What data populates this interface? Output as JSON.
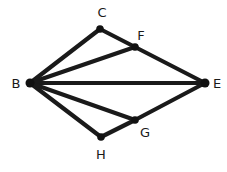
{
  "diagram": {
    "type": "graph",
    "nodes": [
      {
        "id": "B",
        "label": "B",
        "x": 30,
        "y": 83,
        "label_x": 16,
        "label_y": 84
      },
      {
        "id": "C",
        "label": "C",
        "x": 100,
        "y": 29,
        "label_x": 102,
        "label_y": 13
      },
      {
        "id": "F",
        "label": "F",
        "x": 135,
        "y": 47,
        "label_x": 141,
        "label_y": 36
      },
      {
        "id": "E",
        "label": "E",
        "x": 205,
        "y": 83,
        "label_x": 217,
        "label_y": 84
      },
      {
        "id": "G",
        "label": "G",
        "x": 135,
        "y": 120,
        "label_x": 145,
        "label_y": 133
      },
      {
        "id": "H",
        "label": "H",
        "x": 101,
        "y": 137,
        "label_x": 101,
        "label_y": 155
      }
    ],
    "edges": [
      {
        "from": "B",
        "to": "C"
      },
      {
        "from": "C",
        "to": "F"
      },
      {
        "from": "F",
        "to": "E"
      },
      {
        "from": "B",
        "to": "F"
      },
      {
        "from": "B",
        "to": "E"
      },
      {
        "from": "B",
        "to": "G"
      },
      {
        "from": "B",
        "to": "H"
      },
      {
        "from": "H",
        "to": "G"
      },
      {
        "from": "G",
        "to": "E"
      }
    ],
    "colors": {
      "edge": "#1a1a1a",
      "node": "#111111",
      "label": "#1a1a1a",
      "background": "#ffffff"
    }
  }
}
